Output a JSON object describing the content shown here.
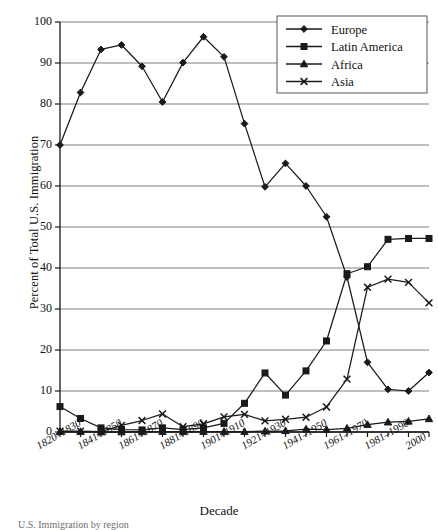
{
  "figure": {
    "xlabel": "Decade",
    "ylabel": "Percent of Total U.S. Immigration",
    "caption": "U.S. Immigration by region"
  },
  "legend": {
    "position": "top-right",
    "entries": [
      {
        "label": "Europe",
        "marker": "diamond-marker"
      },
      {
        "label": "Latin America",
        "marker": "square-marker"
      },
      {
        "label": "Africa",
        "marker": "triangle-marker"
      },
      {
        "label": "Asia",
        "marker": "x-marker"
      }
    ]
  },
  "axes": {
    "y_ticks": [
      "0",
      "10",
      "20",
      "30",
      "40",
      "50",
      "60",
      "70",
      "80",
      "90",
      "100"
    ],
    "x_ticks": [
      "1820–1830",
      "1841–1850",
      "1861–1870",
      "1881–1890",
      "1901–1910",
      "1921–1930",
      "1941–1950",
      "1961–1970",
      "1981–1990",
      "2000"
    ]
  },
  "colors": {
    "line": "#1a1a1a",
    "grid": "#808080",
    "axis": "#1a1a1a",
    "background": "#ffffff"
  },
  "chart_data": {
    "type": "line",
    "title": "",
    "xlabel": "Decade",
    "ylabel": "Percent of Total U.S. Immigration",
    "ylim": [
      0,
      100
    ],
    "yticks": [
      0,
      10,
      20,
      30,
      40,
      50,
      60,
      70,
      80,
      90,
      100
    ],
    "grid": true,
    "legend_position": "top-right",
    "categories": [
      "1820–1830",
      "1831–1840",
      "1841–1850",
      "1851–1860",
      "1861–1870",
      "1871–1880",
      "1881–1890",
      "1891–1900",
      "1901–1910",
      "1911–1920",
      "1921–1930",
      "1931–1940",
      "1941–1950",
      "1951–1960",
      "1961–1970",
      "1971–1980",
      "1981–1990",
      "1991–2000",
      "2000"
    ],
    "series": [
      {
        "name": "Europe",
        "marker": "diamond",
        "values": [
          70.0,
          82.8,
          93.3,
          94.4,
          89.2,
          80.5,
          90.1,
          96.4,
          91.5,
          75.2,
          59.8,
          65.5,
          60.0,
          52.5,
          37.8,
          17.0,
          10.4,
          10.0,
          14.5
        ]
      },
      {
        "name": "Latin America",
        "marker": "square",
        "values": [
          6.2,
          3.3,
          1.0,
          0.6,
          0.5,
          1.0,
          0.6,
          1.0,
          2.1,
          7.0,
          14.4,
          9.0,
          14.9,
          22.2,
          38.6,
          40.3,
          47.0,
          47.2,
          47.2
        ]
      },
      {
        "name": "Africa",
        "marker": "triangle",
        "values": [
          0.1,
          0.1,
          0.0,
          0.0,
          0.1,
          0.1,
          0.1,
          0.1,
          0.1,
          0.1,
          0.2,
          0.3,
          0.7,
          0.6,
          0.9,
          1.8,
          2.4,
          2.6,
          3.2
        ]
      },
      {
        "name": "Asia",
        "marker": "x",
        "values": [
          0.2,
          0.2,
          0.1,
          1.6,
          2.8,
          4.4,
          1.3,
          2.0,
          3.7,
          4.3,
          2.7,
          3.1,
          3.6,
          6.1,
          12.9,
          35.3,
          37.3,
          36.5,
          31.5
        ]
      }
    ]
  }
}
